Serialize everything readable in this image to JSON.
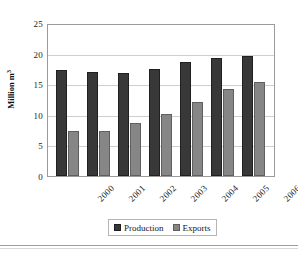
{
  "chart_data": {
    "type": "bar",
    "title": "",
    "xlabel": "",
    "ylabel": "Million m",
    "ylabel_superscript": "3",
    "categories": [
      "2000",
      "2001",
      "2002",
      "2003",
      "2004",
      "2005",
      "2006"
    ],
    "series": [
      {
        "name": "Production",
        "color": "#383838",
        "values": [
          17.6,
          17.3,
          17.0,
          17.8,
          18.9,
          19.5,
          19.9
        ]
      },
      {
        "name": "Exports",
        "color": "#868686",
        "values": [
          7.5,
          7.4,
          8.7,
          10.2,
          12.2,
          14.4,
          15.5
        ]
      }
    ],
    "ylim": [
      0,
      25
    ],
    "yticks": [
      0,
      5,
      10,
      15,
      20,
      25
    ],
    "ytick_labels": [
      "0",
      "5",
      "10",
      "15",
      "20",
      "25"
    ],
    "grid": true,
    "grid_axis": "y",
    "legend_position": "bottom",
    "legend_entries": [
      "Production",
      "Exports"
    ]
  }
}
